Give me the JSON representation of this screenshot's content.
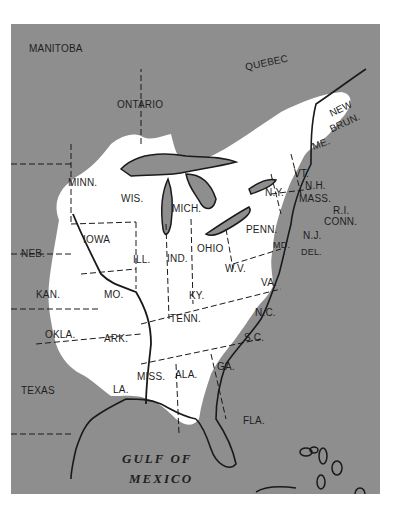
{
  "map": {
    "colors": {
      "background": "#8e8e8e",
      "range": "#ffffff",
      "lines": "#1a1a1a",
      "page": "#ffffff"
    },
    "regions": {
      "manitoba": "MANITOBA",
      "ontario": "ONTARIO",
      "quebec": "QUEBEC",
      "new_brun_1": "NEW",
      "new_brun_2": "BRUN.",
      "me": "ME.",
      "vt": "VT.",
      "nh": "N.H.",
      "mass": "MASS.",
      "ri": "R.I.",
      "conn": "CONN.",
      "ny": "N.Y.",
      "nj": "N.J.",
      "penn": "PENN.",
      "md": "MD.",
      "del": "DEL.",
      "minn": "MINN.",
      "wis": "WIS.",
      "mich": "MICH.",
      "iowa": "IOWA",
      "neb": "NEB.",
      "ill": "ILL.",
      "ind": "IND.",
      "ohio": "OHIO",
      "wv": "W.V.",
      "va": "VA.",
      "kan": "KAN.",
      "mo": "MO.",
      "ky": "KY.",
      "nc": "N.C.",
      "okla": "OKLA.",
      "ark": "ARK.",
      "tenn": "TENN.",
      "sc": "S.C.",
      "texas": "TEXAS",
      "la": "LA.",
      "miss": "MISS.",
      "ala": "ALA.",
      "ga": "GA.",
      "fla": "FLA.",
      "gulf_1": "GULF OF",
      "gulf_2": "MEXICO"
    }
  }
}
